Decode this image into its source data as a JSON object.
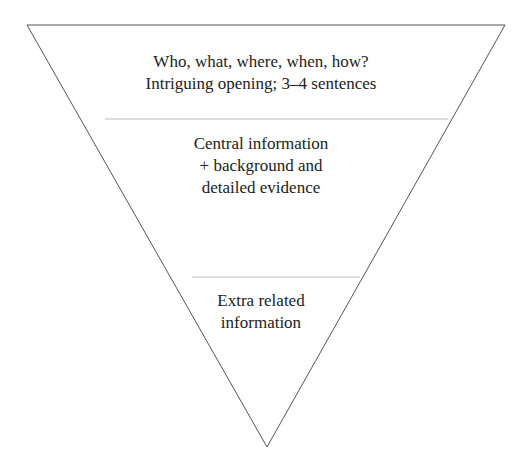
{
  "diagram": {
    "colors": {
      "outline": "#555555",
      "divider": "#bbbbbb",
      "text": "#222222"
    },
    "sections": [
      {
        "lines": [
          "Who, what, where, when, how?",
          "Intriguing opening; 3–4 sentences"
        ]
      },
      {
        "lines": [
          "Central information",
          "+ background and",
          "detailed evidence"
        ]
      },
      {
        "lines": [
          "Extra related",
          "information"
        ]
      }
    ]
  }
}
